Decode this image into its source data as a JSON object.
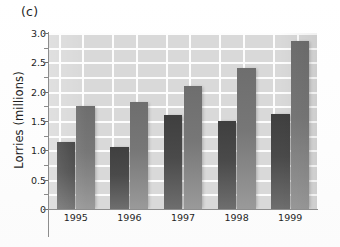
{
  "figure": {
    "panel_label": "(c)"
  },
  "chart_data": {
    "type": "bar",
    "title": "",
    "subtitle": "",
    "panel": "(c)",
    "xlabel": "",
    "ylabel": "Lorries (millions)",
    "categories": [
      "1995",
      "1996",
      "1997",
      "1998",
      "1999"
    ],
    "series": [
      {
        "name": "dark-bar",
        "color": "#4a4a4a",
        "values": [
          1.15,
          1.05,
          1.6,
          1.5,
          1.62
        ]
      },
      {
        "name": "light-bar",
        "color": "#787878",
        "values": [
          1.75,
          1.83,
          2.1,
          2.4,
          2.87
        ]
      }
    ],
    "ylim": [
      0,
      3.0
    ],
    "ytick_labels": [
      "0",
      "0.5",
      "1.0",
      "1.5",
      "2.0",
      "2.5",
      "3.0"
    ],
    "ytick_values": [
      0,
      0.5,
      1.0,
      1.5,
      2.0,
      2.5,
      3.0
    ],
    "yminor_step": 0.25,
    "grid": true,
    "grid_color": "#ffffff",
    "grid_horizontal_step": 0.25,
    "plot_background": "#d9d9d9",
    "legend": null,
    "legend_position": "none",
    "annotations": []
  }
}
